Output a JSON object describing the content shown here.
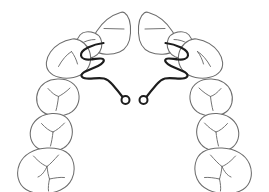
{
  "diagram": {
    "type": "dental-arch-schematic",
    "view": "occlusal",
    "arch": "maxillary",
    "canvas": {
      "width": 269,
      "height": 192,
      "background": "#ffffff"
    },
    "colors": {
      "background": "#ffffff",
      "tooth_outline": "#6d6d6d",
      "tooth_marking": "#6d6d6d",
      "appliance_wire": "#1d1d1d",
      "helix_fill": "#ffffff"
    },
    "stroke_widths": {
      "tooth_outline": 1.05,
      "tooth_marking": 0.95,
      "appliance_wire": 2.15,
      "helix": 2.0
    }
  },
  "teeth": {
    "count": 16,
    "right_quadrant_label": "patient-right",
    "left_quadrant_label": "patient-left",
    "items": [
      {
        "id": "ur1",
        "name": "upper-right-central-incisor",
        "side": "right",
        "type": "central-incisor",
        "marking": "incisal-edge-line",
        "outline": "M 120.5 12.5 C 112.0 15.0 102.5 22.0 96.5 31.5 C 91.5 39.5 90.5 46.5 95.0 50.5 C 100.5 55.0 111.0 55.5 119.5 52.0 C 126.5 49.0 130.0 43.0 130.5 33.0 C 131.0 23.0 128.5 15.5 124.5 12.8 C 123.2 11.9 121.8 12.0 120.5 12.5 Z",
        "markings": [
          "M 104.0 28.5 L 124.0 29.0"
        ]
      },
      {
        "id": "ul1",
        "name": "upper-left-central-incisor",
        "side": "left",
        "type": "central-incisor",
        "marking": "incisal-edge-line",
        "outline": "M 148.5 12.5 C 157.0 15.0 166.5 22.0 172.5 31.5 C 177.5 39.5 178.5 46.5 174.0 50.5 C 168.5 55.0 158.0 55.5 149.5 52.0 C 142.5 49.0 139.0 43.0 138.5 33.0 C 138.0 23.0 140.5 15.5 144.5 12.8 C 145.8 11.9 147.2 12.0 148.5 12.5 Z",
        "markings": [
          "M 145.0 29.0 L 165.0 28.5"
        ]
      },
      {
        "id": "ur2",
        "name": "upper-right-lateral-incisor",
        "side": "right",
        "type": "lateral-incisor",
        "marking": "incisal-edge-line",
        "outline": "M 80.0 35.0 C 76.5 39.5 75.0 45.0 76.5 50.5 C 78.0 55.5 83.0 58.5 89.0 58.0 C 95.0 57.5 100.0 53.5 101.5 47.5 C 103.0 41.0 100.0 35.0 94.5 33.0 C 89.0 31.0 83.0 31.5 80.0 35.0 Z",
        "markings": [
          "M 81.5 43.5 C 85.0 41.0 90.5 39.5 95.0 39.5"
        ]
      },
      {
        "id": "ul2",
        "name": "upper-left-lateral-incisor",
        "side": "left",
        "type": "lateral-incisor",
        "marking": "incisal-edge-line",
        "outline": "M 189.0 35.0 C 192.5 39.5 194.0 45.0 192.5 50.5 C 191.0 55.5 186.0 58.5 180.0 58.0 C 174.0 57.5 169.0 53.5 167.5 47.5 C 166.0 41.0 169.0 35.0 174.5 33.0 C 180.0 31.0 186.0 31.5 189.0 35.0 Z",
        "markings": [
          "M 187.5 43.5 C 184.0 41.0 178.5 39.5 174.0 39.5"
        ]
      },
      {
        "id": "ur3",
        "name": "upper-right-canine",
        "side": "right",
        "type": "canine",
        "marking": "cusp-tip-lines",
        "outline": "M 72.5 39.0 C 64.0 40.5 55.5 45.0 50.5 52.0 C 45.5 59.0 45.0 66.5 49.0 71.5 C 53.5 77.0 63.5 79.5 73.5 77.5 C 83.0 75.5 89.5 69.0 90.5 60.5 C 91.5 51.5 87.0 44.0 80.0 40.5 C 77.5 39.2 75.0 38.6 72.5 39.0 Z",
        "markings": [
          "M 58.5 66.5 C 62.0 60.0 66.5 54.5 71.5 51.5",
          "M 71.5 51.5 C 74.5 55.5 76.5 60.0 77.5 64.0"
        ]
      },
      {
        "id": "ul3",
        "name": "upper-left-canine",
        "side": "left",
        "type": "canine",
        "marking": "cusp-tip-lines",
        "outline": "M 196.5 39.0 C 205.0 40.5 213.5 45.0 218.5 52.0 C 223.5 59.0 224.0 66.5 220.0 71.5 C 215.5 77.0 205.5 79.5 195.5 77.5 C 186.0 75.5 179.5 69.0 178.5 60.5 C 177.5 51.5 182.0 44.0 189.0 40.5 C 191.5 39.2 194.0 38.6 196.5 39.0 Z",
        "markings": [
          "M 210.5 66.5 C 207.0 60.0 202.5 54.5 197.5 51.5",
          "M 197.5 51.5 C 200.5 55.5 202.5 60.0 203.5 64.0"
        ]
      },
      {
        "id": "ur4",
        "name": "upper-right-first-premolar",
        "side": "right",
        "type": "first-premolar",
        "marking": "y-shaped-fissure",
        "outline": "M 57.5 79.0 C 48.5 79.5 41.0 84.0 38.0 91.5 C 35.0 99.0 37.0 107.5 43.0 112.0 C 49.5 117.0 60.5 117.5 69.0 113.5 C 77.0 109.5 80.5 101.0 78.5 92.5 C 76.5 84.0 68.5 78.5 57.5 79.0 Z",
        "markings": [
          "M 48.0 88.5 C 51.5 92.5 55.0 95.5 58.5 96.5",
          "M 70.0 88.0 C 66.0 92.0 61.5 95.0 58.5 96.5",
          "M 58.5 96.5 C 58.0 101.5 57.0 107.0 56.0 110.5"
        ]
      },
      {
        "id": "ul4",
        "name": "upper-left-first-premolar",
        "side": "left",
        "type": "first-premolar",
        "marking": "y-shaped-fissure",
        "outline": "M 211.5 79.0 C 220.5 79.5 228.0 84.0 231.0 91.5 C 234.0 99.0 232.0 107.5 226.0 112.0 C 219.5 117.0 208.5 117.5 200.0 113.5 C 192.0 109.5 188.5 101.0 190.5 92.5 C 192.5 84.0 200.5 78.5 211.5 79.0 Z",
        "markings": [
          "M 221.0 88.5 C 217.5 92.5 214.0 95.5 210.5 96.5",
          "M 199.0 88.0 C 203.0 92.0 207.5 95.0 210.5 96.5",
          "M 210.5 96.5 C 211.0 101.5 212.0 107.0 213.0 110.5"
        ]
      },
      {
        "id": "ur5",
        "name": "upper-right-second-premolar",
        "side": "right",
        "type": "second-premolar",
        "marking": "y-shaped-fissure",
        "outline": "M 52.0 113.5 C 42.5 114.0 34.5 119.0 31.5 127.0 C 28.5 135.0 31.0 143.5 37.5 148.0 C 44.5 152.5 55.5 152.5 63.5 148.0 C 71.0 143.5 74.0 134.5 71.5 126.0 C 69.0 117.5 62.0 113.0 52.0 113.5 Z",
        "markings": [
          "M 41.5 123.5 C 45.5 128.0 49.5 131.0 53.0 132.0",
          "M 64.5 123.0 C 60.5 127.5 56.0 130.5 53.0 132.0",
          "M 53.0 132.0 C 52.5 137.0 51.5 142.5 50.5 146.0"
        ]
      },
      {
        "id": "ul5",
        "name": "upper-left-second-premolar",
        "side": "left",
        "type": "second-premolar",
        "marking": "y-shaped-fissure",
        "outline": "M 217.0 113.5 C 226.5 114.0 234.5 119.0 237.5 127.0 C 240.5 135.0 238.0 143.5 231.5 148.0 C 224.5 152.5 213.5 152.5 205.5 148.0 C 198.0 143.5 195.0 134.5 197.5 126.0 C 200.0 117.5 207.0 113.0 217.0 113.5 Z",
        "markings": [
          "M 227.5 123.5 C 223.5 128.0 219.5 131.0 216.0 132.0",
          "M 204.5 123.0 C 208.5 127.5 213.0 130.5 216.0 132.0",
          "M 216.0 132.0 C 216.5 137.0 217.5 142.5 218.5 146.0"
        ]
      },
      {
        "id": "ur6",
        "name": "upper-right-first-molar",
        "side": "right",
        "type": "first-molar",
        "marking": "molar-fissure-pattern",
        "outline": "M 47.0 148.0 C 34.0 148.5 23.5 154.5 19.5 164.0 C 15.5 173.5 18.0 184.5 26.0 189.5 C 34.5 194.8 49.5 195.0 60.5 190.0 C 71.0 185.2 76.0 174.5 73.5 163.0 C 71.0 152.0 60.5 147.5 47.0 148.0 Z",
        "markings": [
          "M 33.5 156.0 C 38.5 161.5 43.0 165.0 47.0 166.5",
          "M 58.5 155.0 C 54.0 160.0 50.0 164.5 47.0 166.5",
          "M 47.0 166.5 C 45.0 171.0 42.0 175.5 38.0 177.0",
          "M 47.0 166.5 C 47.5 171.5 48.5 176.0 49.5 179.0",
          "M 49.5 179.0 C 54.5 178.0 60.0 177.0 64.5 177.5",
          "M 49.5 179.0 C 48.5 183.5 48.0 188.0 48.5 191.0"
        ]
      },
      {
        "id": "ul6",
        "name": "upper-left-first-molar",
        "side": "left",
        "type": "first-molar",
        "marking": "molar-fissure-pattern",
        "outline": "M 222.0 148.0 C 235.0 148.5 245.5 154.5 249.5 164.0 C 253.5 173.5 251.0 184.5 243.0 189.5 C 234.5 194.8 219.5 195.0 208.5 190.0 C 198.0 185.2 193.0 174.5 195.5 163.0 C 198.0 152.0 208.5 147.5 222.0 148.0 Z",
        "markings": [
          "M 235.5 156.0 C 230.5 161.5 226.0 165.0 222.0 166.5",
          "M 210.5 155.0 C 215.0 160.0 219.0 164.5 222.0 166.5",
          "M 222.0 166.5 C 224.0 171.0 227.0 175.5 231.0 177.0",
          "M 222.0 166.5 C 221.5 171.5 220.5 176.0 219.5 179.0",
          "M 219.5 179.0 C 214.5 178.0 209.0 177.0 204.5 177.5",
          "M 219.5 179.0 C 220.5 183.5 221.0 188.0 220.5 191.0"
        ]
      }
    ]
  },
  "appliance": {
    "name": "removable-orthodontic-appliance",
    "description": "Palatal wire framework with bilateral adjustment loops and terminal helices",
    "components": [
      {
        "id": "wire-right",
        "name": "appliance-wire-right-arm",
        "side": "right",
        "path": "M 103.5 43.0 C 99.0 43.5 93.0 45.0 88.0 47.5 C 83.5 49.8 80.5 52.5 81.0 55.5 C 81.5 58.5 85.5 60.0 90.5 59.5 C 96.0 59.0 101.0 57.5 103.0 59.0 C 105.0 60.5 103.0 63.5 98.0 66.0 C 92.5 68.8 86.0 70.5 83.0 73.0 C 80.0 75.5 81.5 78.0 86.5 78.5 C 91.5 79.0 98.5 77.5 104.0 78.5 C 107.5 79.2 109.5 81.0 112.0 84.0 C 115.5 88.0 120.0 93.5 123.0 97.5"
      },
      {
        "id": "wire-left",
        "name": "appliance-wire-left-arm",
        "side": "left",
        "path": "M 165.5 43.0 C 170.0 43.5 176.0 45.0 181.0 47.5 C 185.5 49.8 188.5 52.5 188.0 55.5 C 187.5 58.5 183.5 60.0 178.5 59.5 C 173.0 59.0 168.0 57.5 166.0 59.0 C 164.0 60.5 166.0 63.5 171.0 66.0 C 176.5 68.8 183.0 70.5 186.0 73.0 C 189.0 75.5 187.5 78.0 182.5 78.5 C 177.5 79.0 170.5 77.5 165.0 78.5 C 161.5 79.2 159.5 81.0 157.0 84.0 C 153.5 88.0 149.0 93.5 146.0 97.5"
      },
      {
        "id": "helix-right",
        "name": "appliance-helix-loop-right",
        "side": "right",
        "shape": "circle",
        "cx": 125.5,
        "cy": 100.0,
        "r": 4.0
      },
      {
        "id": "helix-left",
        "name": "appliance-helix-loop-left",
        "side": "left",
        "shape": "circle",
        "cx": 143.5,
        "cy": 100.0,
        "r": 4.0
      }
    ]
  }
}
